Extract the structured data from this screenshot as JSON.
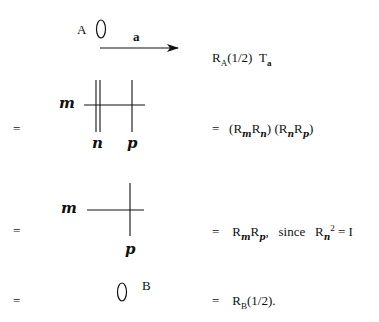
{
  "rows": [
    {
      "diagram": {
        "point_label": "A",
        "vector_label": "a",
        "shape": "oval-with-arrow"
      },
      "equation": {
        "prefix": "",
        "base1": "R",
        "sub1": "A",
        "arg1": "(1/2)",
        "base2": "T",
        "sub2": "a"
      }
    },
    {
      "left_eq": "=",
      "diagram": {
        "line_labels": [
          "m",
          "n",
          "p"
        ],
        "shape": "line-m-crossed-by-double-n-and-p"
      },
      "equation": {
        "prefix": "=",
        "open1": "(",
        "base1": "R",
        "sub1": "m",
        "base2": "R",
        "sub2": "n",
        "close1": ")",
        "open2": "(",
        "base3": "R",
        "sub3": "n",
        "base4": "R",
        "sub4": "p",
        "close2": ")"
      }
    },
    {
      "left_eq": "=",
      "diagram": {
        "line_labels": [
          "m",
          "p"
        ],
        "shape": "line-m-crossed-by-p"
      },
      "equation": {
        "prefix": "=",
        "base1": "R",
        "sub1": "m",
        "base2": "R",
        "sub2": "p",
        "comma": ",",
        "since": "since",
        "base3": "R",
        "sub3": "n",
        "sup3": "2",
        "eq": "=",
        "identity": "I"
      }
    },
    {
      "left_eq": "=",
      "diagram": {
        "point_label": "B",
        "shape": "oval"
      },
      "equation": {
        "prefix": "=",
        "base1": "R",
        "sub1": "B",
        "arg1": "(1/2)."
      }
    }
  ]
}
